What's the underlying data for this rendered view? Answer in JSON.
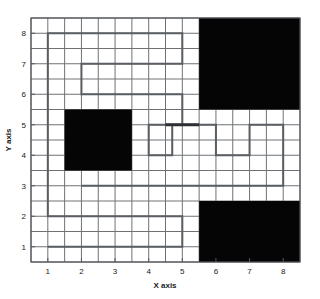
{
  "figure": {
    "background_color": "#ffffff",
    "plot_area": {
      "x": 31,
      "y": 18,
      "width": 269,
      "height": 244
    },
    "border_color": "#55585c",
    "grid_color": "#6e7276"
  },
  "chart_data": {
    "type": "line",
    "title": "",
    "xlabel": "X axis",
    "ylabel": "Y axis",
    "xlim": [
      0.5,
      8.5
    ],
    "ylim": [
      0.5,
      8.5
    ],
    "xticks": [
      1,
      2,
      3,
      4,
      5,
      6,
      7,
      8
    ],
    "yticks": [
      1,
      2,
      3,
      4,
      5,
      6,
      7,
      8
    ],
    "xtick_labels": [
      "1",
      "2",
      "3",
      "4",
      "5",
      "6",
      "7",
      "8"
    ],
    "ytick_labels": [
      "1",
      "2",
      "3",
      "4",
      "5",
      "6",
      "7",
      "8"
    ],
    "grid": true,
    "grid_minor_step": 0.5,
    "legend": "none",
    "obstacles": [
      {
        "name": "top-right-obstacle",
        "x0": 5.5,
        "y0": 5.5,
        "x1": 8.5,
        "y1": 8.5,
        "color": "#050505"
      },
      {
        "name": "middle-left-obstacle",
        "x0": 1.5,
        "y0": 3.5,
        "x1": 3.5,
        "y1": 5.5,
        "color": "#050505"
      },
      {
        "name": "bottom-right-obstacle",
        "x0": 5.5,
        "y0": 0.5,
        "x1": 8.5,
        "y1": 2.5,
        "color": "#050505"
      }
    ],
    "path_color": "#5a5e62",
    "path_width": 2.0,
    "path_points": [
      [
        1,
        1
      ],
      [
        5,
        1
      ],
      [
        5,
        2
      ],
      [
        1,
        2
      ],
      [
        1,
        8
      ],
      [
        5,
        8
      ],
      [
        5,
        7
      ],
      [
        2,
        7
      ],
      [
        2,
        6
      ],
      [
        5,
        6
      ],
      [
        5,
        5
      ],
      [
        4,
        5
      ],
      [
        4,
        4
      ],
      [
        4.7,
        4
      ],
      [
        4.7,
        5
      ],
      [
        6,
        5
      ],
      [
        6,
        4
      ],
      [
        7,
        4
      ],
      [
        7,
        5
      ],
      [
        8,
        5
      ],
      [
        8,
        3
      ],
      [
        2,
        3
      ]
    ],
    "path_highlight": {
      "name": "emphasized-segment",
      "from": [
        4.5,
        5
      ],
      "to": [
        5.5,
        5
      ],
      "color": "#2c2f33",
      "width": 3.0
    }
  }
}
